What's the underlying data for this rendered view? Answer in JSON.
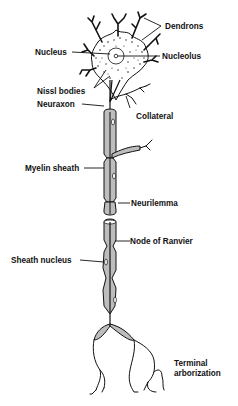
{
  "figure": {
    "labels": {
      "dendrons": "Dendrons",
      "nucleus": "Nucleus",
      "nucleolus": "Nucleolus",
      "nissl_bodies": "Nissl bodies",
      "neuraxon": "Neuraxon",
      "collateral": "Collateral",
      "myelin_sheath": "Myelin sheath",
      "neurilemma": "Neurilemma",
      "node_of_ranvier": "Node of Ranvier",
      "sheath_nucleus": "Sheath nucleus",
      "terminal_line1": "Terminal",
      "terminal_line2": "arborization"
    }
  }
}
